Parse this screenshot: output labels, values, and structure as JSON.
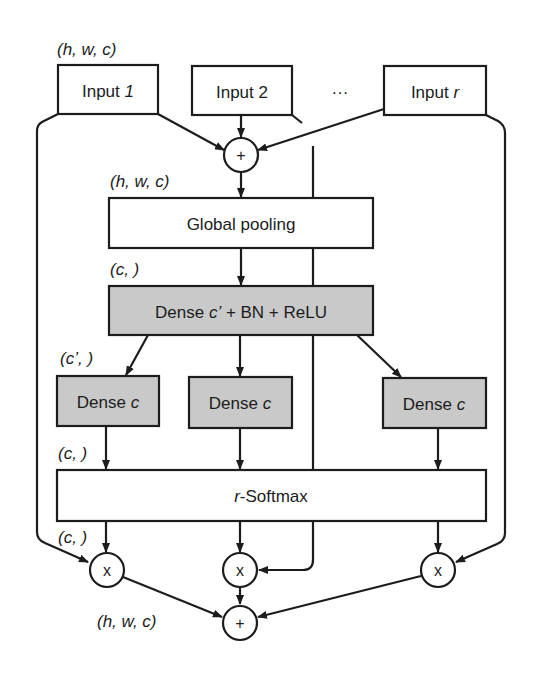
{
  "inputs": [
    {
      "prefix": "Input ",
      "index": "1"
    },
    {
      "prefix": "Input ",
      "index": "2"
    },
    {
      "prefix": "Input ",
      "index": "r"
    }
  ],
  "ellipsis": "···",
  "ops": {
    "sum": "+",
    "mul": "x"
  },
  "blocks": {
    "global_pooling": "Global pooling",
    "dense_reduce": {
      "prefix": "Dense ",
      "var": "c’",
      "suffix": " + BN + ReLU"
    },
    "dense_expand": {
      "prefix": "Dense ",
      "var": "c"
    },
    "softmax": {
      "var": "r",
      "suffix": "-Softmax"
    }
  },
  "shapes": {
    "input": "(h, w, c)",
    "after_sum": "(h, w, c)",
    "after_pool": "(c, )",
    "after_reduce": "(c’, )",
    "after_dense": "(c, )",
    "after_softmax": "(c, )",
    "output": "(h, w, c)"
  }
}
